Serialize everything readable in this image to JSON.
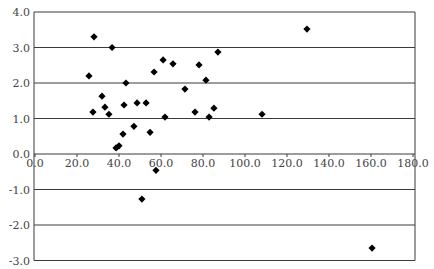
{
  "chart_data": {
    "type": "scatter",
    "title": "",
    "xlabel": "",
    "ylabel": "",
    "xlim": [
      0,
      180
    ],
    "ylim": [
      -3,
      4
    ],
    "x_ticks": [
      "0.0",
      "20.0",
      "40.0",
      "60.0",
      "80.0",
      "100.0",
      "120.0",
      "140.0",
      "160.0",
      "180.0"
    ],
    "y_ticks": [
      "4.0",
      "3.0",
      "2.0",
      "1.0",
      "0.0",
      "-1.0",
      "-2.0",
      "-3.0"
    ],
    "grid": "horizontal",
    "legend": null,
    "marker": "diamond",
    "marker_color": "#000000",
    "series": [
      {
        "name": "data",
        "points": [
          [
            28.1,
            3.3
          ],
          [
            36.7,
            3.0
          ],
          [
            25.7,
            2.2
          ],
          [
            43.3,
            2.0
          ],
          [
            56.7,
            2.31
          ],
          [
            31.9,
            1.63
          ],
          [
            33.3,
            1.32
          ],
          [
            42.4,
            1.38
          ],
          [
            48.6,
            1.44
          ],
          [
            52.9,
            1.44
          ],
          [
            27.6,
            1.18
          ],
          [
            35.2,
            1.12
          ],
          [
            41.9,
            0.56
          ],
          [
            47.1,
            0.78
          ],
          [
            54.8,
            0.61
          ],
          [
            38.6,
            0.17
          ],
          [
            40.0,
            0.23
          ],
          [
            87.1,
            2.87
          ],
          [
            61.0,
            2.65
          ],
          [
            65.7,
            2.54
          ],
          [
            78.1,
            2.51
          ],
          [
            81.4,
            2.08
          ],
          [
            71.4,
            1.83
          ],
          [
            76.2,
            1.18
          ],
          [
            85.2,
            1.29
          ],
          [
            61.9,
            1.04
          ],
          [
            82.9,
            1.04
          ],
          [
            108.1,
            1.12
          ],
          [
            57.6,
            -0.46
          ],
          [
            50.9,
            -1.27
          ],
          [
            129.5,
            3.52
          ],
          [
            160.5,
            -2.65
          ]
        ]
      }
    ]
  }
}
